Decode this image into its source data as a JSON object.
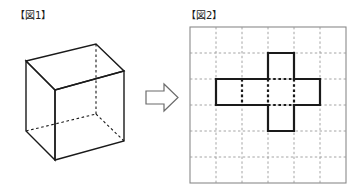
{
  "figure1": {
    "label": "【図1】",
    "caption_text": "【図1】",
    "shape_name": "cube",
    "description": "wireframe cube drawn in oblique projection with hidden edges dashed",
    "line_color": "#1a1a1a",
    "hidden_edge_style": "dashed",
    "visible_edge_style": "solid"
  },
  "arrow": {
    "icon_name": "block-arrow-right-icon",
    "direction": "right",
    "fill_color": "#ffffff",
    "stroke_color": "#6b6b6b"
  },
  "figure2": {
    "label": "【図2】",
    "caption_text": "【図2】",
    "shape_name": "cube-net-cross",
    "description": "cross shaped cube net drawn on a 6 by 6 grid",
    "grid": {
      "columns": 6,
      "rows": 6,
      "border_color": "#8a8a8a",
      "gridline_color": "#9a9a9a",
      "gridline_style": "dashed"
    },
    "net": {
      "outline_color": "#1a1a1a",
      "fold_line_color": "#1a1a1a",
      "fold_line_style": "dotted",
      "cells": [
        {
          "col": 2,
          "row": 0
        },
        {
          "col": 0,
          "row": 1
        },
        {
          "col": 1,
          "row": 1
        },
        {
          "col": 2,
          "row": 1
        },
        {
          "col": 3,
          "row": 1
        },
        {
          "col": 2,
          "row": 2
        }
      ],
      "cell_count": 6
    }
  }
}
